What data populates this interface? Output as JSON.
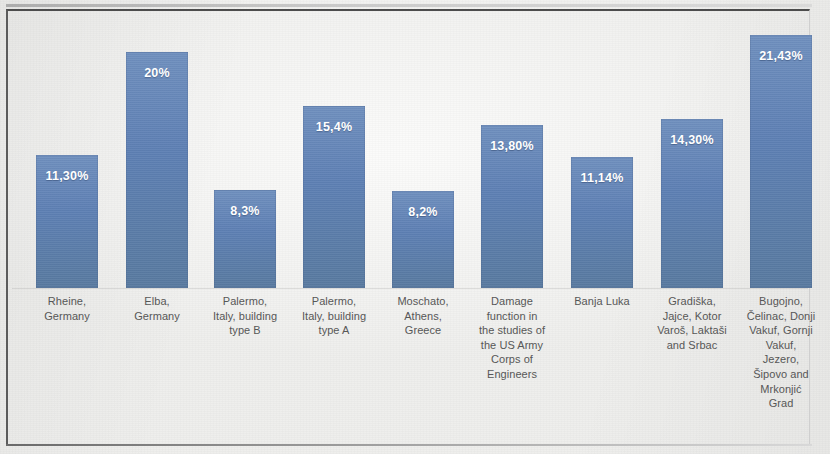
{
  "chart_data": {
    "type": "bar",
    "title": "",
    "subtitle": "",
    "xlabel": "",
    "ylabel": "",
    "ylim": [
      0,
      23.5
    ],
    "grid": false,
    "legend": "none",
    "value_label_format": "percent-comma",
    "bar_color": "#5d7fb3",
    "label_color": "#ffffff",
    "axis_label_color": "#575757",
    "background_color": "#f7f7f5",
    "categories": [
      "Rheine, Germany",
      "Elba, Germany",
      "Palermo, Italy, building type B",
      "Palermo, Italy, building type A",
      "Moschato, Athens, Greece",
      "Damage function in the studies of the US Army Corps of Engineers",
      "Banja Luka",
      "Gradiška, Jajce, Kotor Varoš, Laktaši and Srbac",
      "Bugojno, Čelinac, Donji Vakuf, Gornji Vakuf, Jezero, Šipovo and Mrkonjić Grad"
    ],
    "category_lines": [
      [
        "Rheine,",
        "Germany"
      ],
      [
        "Elba,",
        "Germany"
      ],
      [
        "Palermo,",
        "Italy, building",
        "type B"
      ],
      [
        "Palermo,",
        "Italy, building",
        "type A"
      ],
      [
        "Moschato,",
        "Athens,",
        "Greece"
      ],
      [
        "Damage",
        "function in",
        "the studies of",
        "the US Army",
        "Corps of",
        "Engineers"
      ],
      [
        "Banja Luka"
      ],
      [
        "Gradiška,",
        "Jajce, Kotor",
        "Varoš, Laktaši",
        "and Srbac"
      ],
      [
        "Bugojno,",
        "Čelinac, Donji",
        "Vakuf, Gornji",
        "Vakuf,",
        "Jezero,",
        "Šipovo and",
        "Mrkonjić",
        "Grad"
      ]
    ],
    "values": [
      11.3,
      20.0,
      8.3,
      15.4,
      8.2,
      13.8,
      11.14,
      14.3,
      21.43
    ],
    "value_labels": [
      "11,30%",
      "20%",
      "8,3%",
      "15,4%",
      "8,2%",
      "13,80%",
      "11,14%",
      "14,30%",
      "21,43%"
    ]
  }
}
